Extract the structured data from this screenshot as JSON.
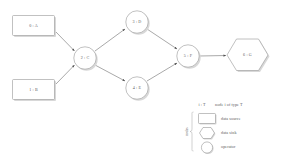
{
  "diagram": {
    "nodes": [
      {
        "id": "A",
        "label": "0 : A",
        "shape": "rectangle",
        "kind": "data source",
        "cx": 34,
        "cy": 26
      },
      {
        "id": "B",
        "label": "1 : B",
        "shape": "rectangle",
        "kind": "data source",
        "cx": 34,
        "cy": 90
      },
      {
        "id": "C",
        "label": "2 : C",
        "shape": "circle",
        "kind": "operator",
        "cx": 85,
        "cy": 58
      },
      {
        "id": "D",
        "label": "3 : D",
        "shape": "circle",
        "kind": "operator",
        "cx": 137,
        "cy": 22
      },
      {
        "id": "E",
        "label": "4 : E",
        "shape": "circle",
        "kind": "operator",
        "cx": 137,
        "cy": 88
      },
      {
        "id": "F",
        "label": "5 : F",
        "shape": "circle",
        "kind": "operator",
        "cx": 188,
        "cy": 56
      },
      {
        "id": "G",
        "label": "6 : G",
        "shape": "hexagon",
        "kind": "data sink",
        "cx": 247,
        "cy": 55
      }
    ],
    "edges": [
      {
        "from": "A",
        "to": "C"
      },
      {
        "from": "B",
        "to": "C"
      },
      {
        "from": "C",
        "to": "D"
      },
      {
        "from": "C",
        "to": "E"
      },
      {
        "from": "D",
        "to": "F"
      },
      {
        "from": "E",
        "to": "F"
      },
      {
        "from": "F",
        "to": "G"
      }
    ]
  },
  "legend": {
    "notation_key": "i : T",
    "notation_description": "node i of type T",
    "group_label": "nodes",
    "items": [
      {
        "shape": "rectangle",
        "label": "data source"
      },
      {
        "shape": "hexagon",
        "label": "data sink"
      },
      {
        "shape": "circle",
        "label": "operator"
      }
    ]
  },
  "colors": {
    "stroke": "#8d8d8d",
    "edge": "#6f6f6f",
    "text": "#5a5a5a",
    "shadow": "#d8d8d8",
    "background": "#ffffff"
  }
}
